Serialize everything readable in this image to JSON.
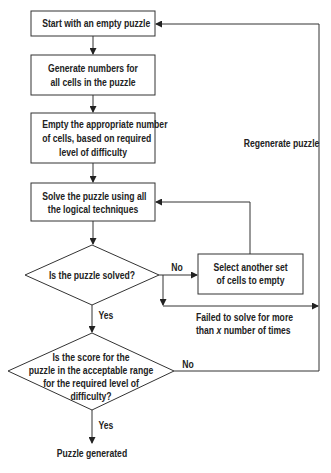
{
  "diagram": {
    "type": "flowchart",
    "nodes": {
      "start": "Start with an empty puzzle",
      "generate_1": "Generate numbers for",
      "generate_2": "all cells in the puzzle",
      "empty_1": "Empty the appropriate number",
      "empty_2": "of cells, based on required",
      "empty_3": "level of difficulty",
      "solve_1": "Solve the puzzle using all",
      "solve_2": "the logical techniques",
      "solved_q": "Is the puzzle solved?",
      "select_1": "Select another set",
      "select_2": "of cells to empty",
      "score_1": "Is the score for the",
      "score_2": "puzzle in the acceptable range",
      "score_3": "for the required level of",
      "score_4": "difficulty?",
      "end": "Puzzle generated"
    },
    "edge_labels": {
      "no_1": "No",
      "yes_1": "Yes",
      "no_2": "No",
      "yes_2": "Yes",
      "failed_1": "Failed to solve for more",
      "failed_2_pre": "than ",
      "failed_2_x": "x",
      "failed_2_post": " number of times",
      "regenerate": "Regenerate puzzle"
    }
  }
}
